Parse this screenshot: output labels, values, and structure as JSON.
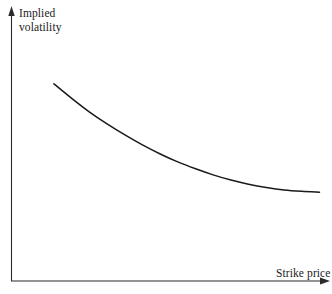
{
  "figure": {
    "background_color": "#ffffff",
    "line_color": "#1a1a1a",
    "axis_color": "#2b2b2b",
    "width": 332,
    "height": 294
  },
  "axes": {
    "y_axis": {
      "label_line1": "Implied",
      "label_line2": "volatility",
      "arrow": "up-arrow"
    },
    "x_axis": {
      "label": "Strike price",
      "arrow": "right-arrow"
    }
  },
  "chart_data": {
    "type": "line",
    "title": "",
    "subtitle": "",
    "xlabel": "Strike price",
    "ylabel": "Implied volatility",
    "grid": false,
    "legend": null,
    "annotations": [],
    "axis_ticks": {
      "x": [],
      "y": []
    },
    "xlim": [
      0,
      1
    ],
    "ylim": [
      0,
      1
    ],
    "series": [
      {
        "name": "Implied volatility curve",
        "x": [
          0.133,
          0.189,
          0.244,
          0.3,
          0.356,
          0.411,
          0.467,
          0.522,
          0.578,
          0.633,
          0.689,
          0.744,
          0.8,
          0.856,
          0.911,
          0.967
        ],
        "y": [
          0.717,
          0.664,
          0.615,
          0.571,
          0.531,
          0.495,
          0.462,
          0.433,
          0.408,
          0.386,
          0.367,
          0.352,
          0.34,
          0.331,
          0.326,
          0.323
        ]
      }
    ]
  }
}
